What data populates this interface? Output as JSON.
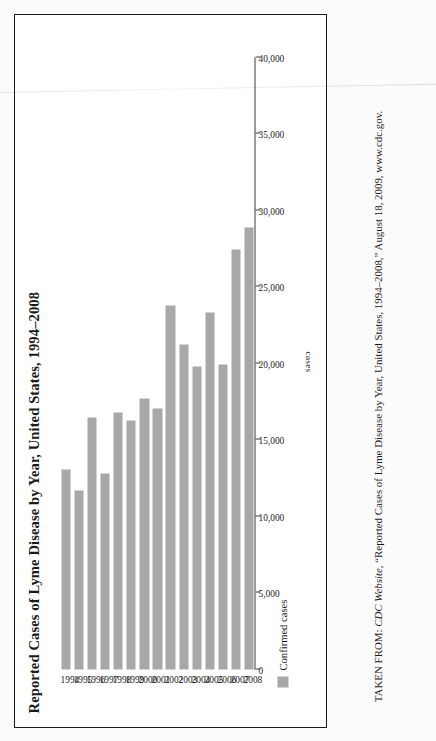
{
  "figure": {
    "title": "Reported Cases of Lyme Disease by Year, United States, 1994–2008",
    "axis_title": "cases",
    "legend": {
      "label": "Confirmed cases",
      "swatch_color": "#a8a8a8"
    },
    "source": {
      "prefix": "TAKEN FROM: ",
      "publisher": "CDC Website,",
      "quoted_title": " “Reported Cases of Lyme Disease by Year, United States, 1994–2008,”",
      "date": " August 18, 2009,",
      "url": " www.cdc.gov."
    }
  },
  "chart_data": {
    "type": "bar",
    "orientation": "horizontal",
    "title": "Reported Cases of Lyme Disease by Year, United States, 1994–2008",
    "xlabel": "",
    "ylabel": "cases",
    "categories": [
      "1994",
      "1995",
      "1996",
      "1997",
      "1998",
      "1999",
      "2000",
      "2001",
      "2002",
      "2003",
      "2004",
      "2005",
      "2006",
      "2007",
      "2008"
    ],
    "series": [
      {
        "name": "Confirmed cases",
        "color": "#a8a8a8",
        "values": [
          13043,
          11700,
          16455,
          12801,
          16801,
          16273,
          17730,
          17029,
          23763,
          21273,
          19804,
          23305,
          19931,
          27444,
          28921
        ]
      }
    ],
    "ylim": [
      0,
      40000
    ],
    "tick_values": [
      0,
      5000,
      10000,
      15000,
      20000,
      25000,
      30000,
      35000,
      40000
    ],
    "tick_labels": [
      "0",
      "5,000",
      "10,000",
      "15,000",
      "20,000",
      "25,000",
      "30,000",
      "35,000",
      "40,000"
    ],
    "grid": false,
    "legend_position": "bottom-left"
  }
}
